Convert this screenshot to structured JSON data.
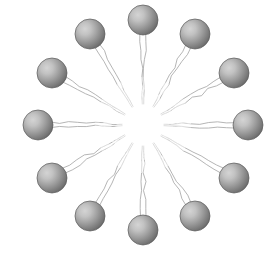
{
  "figure": {
    "canvas": {
      "width": 280,
      "height": 253,
      "background_color": "#ffffff"
    },
    "hub": {
      "center_x": 143,
      "center_y": 125,
      "empty_radius": 34,
      "fill_color": "#ffffff",
      "label": "empty white hub"
    },
    "ring": {
      "node_count": 12,
      "radius": 105,
      "angle_step_degrees": 30,
      "start_angle_degrees": -90
    },
    "node_style": {
      "diameter": 30,
      "radius": 15,
      "highlight_color": "#cfcfcf",
      "mid_color": "#9a9a9a",
      "edge_color": "#6e6e6e",
      "outline_color": "#5a5a5a",
      "highlight_offset_x": -0.33,
      "highlight_offset_y": -0.33
    },
    "spoke_style": {
      "strands_per_node": 2,
      "stroke_color": "#9e9e9e",
      "stroke_width": 0.9,
      "waviness": 2.2,
      "fade_start_radius": 34,
      "pair_separation_degrees": 3.6
    },
    "nodes": [
      {
        "index": 1,
        "clock_position": "12:00",
        "angle_degrees": -90,
        "cx": 143,
        "cy": 20,
        "strands": 2
      },
      {
        "index": 2,
        "clock_position": "1:00",
        "angle_degrees": -60,
        "cx": 195,
        "cy": 34,
        "strands": 2
      },
      {
        "index": 3,
        "clock_position": "2:00",
        "angle_degrees": -30,
        "cx": 234,
        "cy": 73,
        "strands": 2
      },
      {
        "index": 4,
        "clock_position": "3:00",
        "angle_degrees": 0,
        "cx": 248,
        "cy": 125,
        "strands": 2
      },
      {
        "index": 5,
        "clock_position": "4:00",
        "angle_degrees": 30,
        "cx": 234,
        "cy": 178,
        "strands": 2
      },
      {
        "index": 6,
        "clock_position": "5:00",
        "angle_degrees": 60,
        "cx": 195,
        "cy": 216,
        "strands": 2
      },
      {
        "index": 7,
        "clock_position": "6:00",
        "angle_degrees": 90,
        "cx": 143,
        "cy": 230,
        "strands": 2
      },
      {
        "index": 8,
        "clock_position": "7:00",
        "angle_degrees": 120,
        "cx": 90,
        "cy": 216,
        "strands": 2
      },
      {
        "index": 9,
        "clock_position": "8:00",
        "angle_degrees": 150,
        "cx": 52,
        "cy": 178,
        "strands": 2
      },
      {
        "index": 10,
        "clock_position": "9:00",
        "angle_degrees": 180,
        "cx": 38,
        "cy": 125,
        "strands": 2
      },
      {
        "index": 11,
        "clock_position": "10:00",
        "angle_degrees": 210,
        "cx": 52,
        "cy": 73,
        "strands": 2
      },
      {
        "index": 12,
        "clock_position": "11:00",
        "angle_degrees": 240,
        "cx": 90,
        "cy": 34,
        "strands": 2
      }
    ]
  }
}
